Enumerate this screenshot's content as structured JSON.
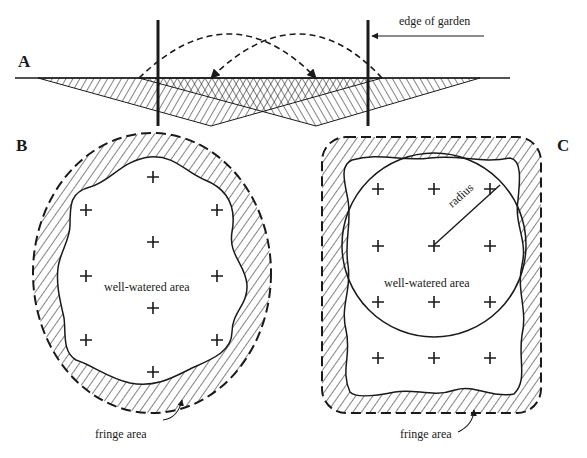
{
  "panels": {
    "A": {
      "letter": "A",
      "edge_label": "edge of garden"
    },
    "B": {
      "letter": "B",
      "center_label": "well-watered area",
      "fringe_label": "fringe area"
    },
    "C": {
      "letter": "C",
      "center_label": "well-watered area",
      "fringe_label": "fringe area",
      "radius_label": "radius"
    }
  },
  "colors": {
    "ink": "#1a1a1a",
    "background": "#ffffff"
  }
}
